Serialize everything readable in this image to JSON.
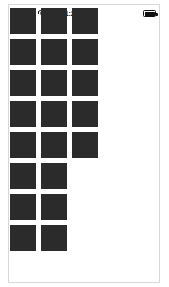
{
  "screen": {
    "width": 169,
    "height": 287,
    "background_color": "#ffffff",
    "frame_border_color": "#d8d8d8"
  },
  "status_bar": {
    "carrier_label": "Carrier",
    "wifi_icon": "wifi-icon",
    "time": "11:23 AM",
    "battery_icon": "battery-icon",
    "battery_level_percent": 100,
    "text_color": "#111111"
  },
  "tile_grid": {
    "tile_color": "#2b2b2b",
    "tile_size": 26,
    "gap": 5,
    "origin_x": 10,
    "origin_y": 8,
    "columns": 3,
    "column_row_counts": [
      8,
      8,
      5
    ],
    "tiles": [
      {
        "col": 0,
        "row": 0
      },
      {
        "col": 1,
        "row": 0
      },
      {
        "col": 2,
        "row": 0
      },
      {
        "col": 0,
        "row": 1
      },
      {
        "col": 1,
        "row": 1
      },
      {
        "col": 2,
        "row": 1
      },
      {
        "col": 0,
        "row": 2
      },
      {
        "col": 1,
        "row": 2
      },
      {
        "col": 2,
        "row": 2
      },
      {
        "col": 0,
        "row": 3
      },
      {
        "col": 1,
        "row": 3
      },
      {
        "col": 2,
        "row": 3
      },
      {
        "col": 0,
        "row": 4
      },
      {
        "col": 1,
        "row": 4
      },
      {
        "col": 2,
        "row": 4
      },
      {
        "col": 0,
        "row": 5
      },
      {
        "col": 1,
        "row": 5
      },
      {
        "col": 0,
        "row": 6
      },
      {
        "col": 1,
        "row": 6
      },
      {
        "col": 0,
        "row": 7
      },
      {
        "col": 1,
        "row": 7
      }
    ]
  },
  "content_pane": {
    "background_color": "#ffffff"
  }
}
